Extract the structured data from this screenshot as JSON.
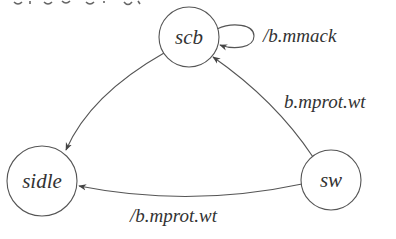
{
  "diagram": {
    "type": "state-machine",
    "line_color": "#555555",
    "text_color": "#333333",
    "states": [
      {
        "id": "scb",
        "label": "scb",
        "cx": 189,
        "cy": 37,
        "r": 30
      },
      {
        "id": "sidle",
        "label": "sidle",
        "cx": 42,
        "cy": 181,
        "r": 35
      },
      {
        "id": "sw",
        "label": "sw",
        "cx": 331,
        "cy": 180,
        "r": 30
      }
    ],
    "transitions": [
      {
        "from": "scb",
        "to": "scb",
        "label": "/b.mmack"
      },
      {
        "from": "scb",
        "to": "sidle",
        "label": ""
      },
      {
        "from": "sw",
        "to": "scb",
        "label": "b.mprot.wt"
      },
      {
        "from": "sw",
        "to": "sidle",
        "label": "/b.mprot.wt"
      }
    ]
  }
}
